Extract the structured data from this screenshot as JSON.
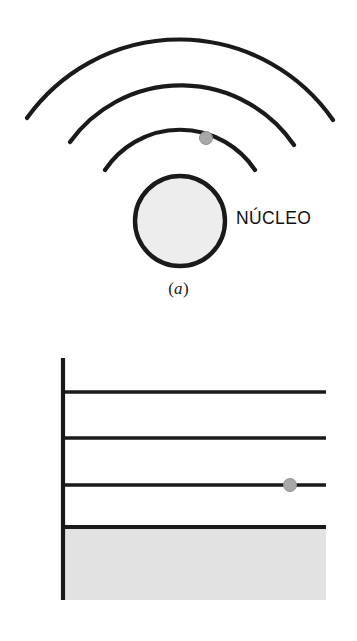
{
  "figure": {
    "background_color": "#ffffff",
    "stroke_color": "#1a1a1a",
    "nucleus_fill": "#ededed",
    "shaded_fill": "#e2e2e2",
    "electron_fill": "#a8a8a8",
    "electron_stroke": "#8f8f8f"
  },
  "panel_a": {
    "caption_paren_open": "(",
    "caption_letter": "a",
    "caption_paren_close": ")",
    "nucleus_label": "NÚCLEO",
    "electron_name": "eletron",
    "orbit_count": 3,
    "orbits": [
      {
        "name": "orbita-externa",
        "radius": 187,
        "apex_y": 34
      },
      {
        "name": "orbita-media",
        "radius": 137,
        "apex_y": 84
      },
      {
        "name": "orbita-interna",
        "radius": 90,
        "apex_y": 131
      }
    ],
    "nucleus": {
      "cx": 180,
      "cy": 221,
      "r": 45
    },
    "electron": {
      "cx": 206,
      "cy": 138,
      "r": 6.5
    }
  },
  "panel_b": {
    "caption_paren_open": "(",
    "caption_letter": "b",
    "caption_paren_close": ")",
    "core_label": "BORDA DO NÚCLEO",
    "levels": [
      {
        "symbol": "r",
        "subscript": "3",
        "y": 392
      },
      {
        "symbol": "r",
        "subscript": "2",
        "y": 438
      },
      {
        "symbol": "r",
        "subscript": "1",
        "y": 485
      }
    ],
    "axis": {
      "x": 63,
      "top": 358,
      "bottom": 600
    },
    "line_right_x": 326,
    "core_edge_y": 527,
    "electron": {
      "cx": 290,
      "cy": 485,
      "r": 6.5
    }
  }
}
